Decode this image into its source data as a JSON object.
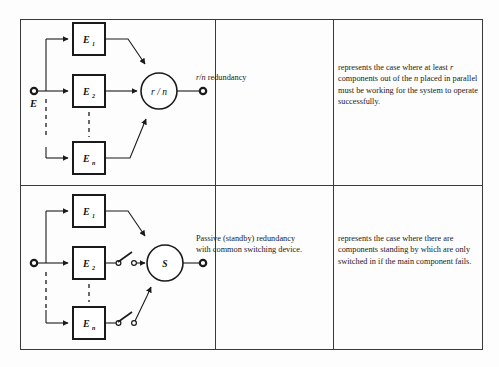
{
  "figure": {
    "type": "redundancy-configuration-table",
    "columns": [
      "diagram",
      "name",
      "description"
    ],
    "rows": [
      {
        "id": "rn-redundancy",
        "label_plain": "r/n redundancy",
        "label_parts": [
          {
            "text": "r",
            "style": "italic"
          },
          {
            "text": "/",
            "style": "normal"
          },
          {
            "text": "n",
            "style": "italic"
          },
          {
            "text": " redundancy",
            "style": "normal"
          }
        ],
        "description_plain": "represents the case where at least r components out of the n placed in parallel must be working for the system to operate successfully.",
        "description_parts": [
          {
            "text": "represents the case where at least ",
            "style": "normal"
          },
          {
            "text": "r",
            "style": "italic"
          },
          {
            "text": " components out of the ",
            "style": "normal"
          },
          {
            "text": "n",
            "style": "italic"
          },
          {
            "text": " placed in parallel must be working for the system to operate successfully.",
            "style": "normal"
          }
        ],
        "diagram": {
          "input_terminal_label": "E",
          "output_terminal_label": "",
          "blocks": [
            {
              "label": "E",
              "subscript": "1"
            },
            {
              "label": "E",
              "subscript": "2"
            },
            {
              "label": "E",
              "subscript": "n"
            }
          ],
          "node": {
            "shape": "circle",
            "label": "r / n"
          },
          "has_switches": false,
          "dashed_continuation": true
        }
      },
      {
        "id": "passive-standby-redundancy",
        "label_plain": "Passive (standby) redundancy with common switching device.",
        "label_parts": [
          {
            "text": "Passive (standby) redundancy with common switching device.",
            "style": "normal"
          }
        ],
        "description_plain": "represents the case where there are components standing by which are only switched in if the main component fails.",
        "description_parts": [
          {
            "text": "represents the case where there are components standing by which are only switched in if the main component fails.",
            "style": "normal"
          }
        ],
        "diagram": {
          "input_terminal_label": "",
          "output_terminal_label": "",
          "blocks": [
            {
              "label": "E",
              "subscript": "1"
            },
            {
              "label": "E",
              "subscript": "2"
            },
            {
              "label": "E",
              "subscript": "n"
            }
          ],
          "node": {
            "shape": "circle",
            "label": "S"
          },
          "has_switches": true,
          "switch_count": 2,
          "dashed_continuation": true
        }
      }
    ]
  },
  "style": {
    "line_color": "#1a1a1a",
    "border_color": "#3a3a3a",
    "background": "#fdfdfd",
    "text_color": "#1a1a1a"
  }
}
